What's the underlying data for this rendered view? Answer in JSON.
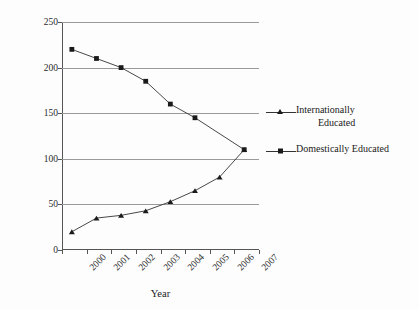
{
  "chart_data": {
    "type": "line",
    "title": "",
    "xlabel": "Year",
    "ylabel": "Number of Full-Time Nurses",
    "categories": [
      "2000",
      "2001",
      "2002",
      "2003",
      "2004",
      "2005",
      "2006",
      "2007"
    ],
    "x": [
      2000,
      2001,
      2002,
      2003,
      2004,
      2005,
      2006,
      2007
    ],
    "ylim": [
      0,
      250
    ],
    "yticks": [
      0,
      50,
      100,
      150,
      200,
      250
    ],
    "grid": "horizontal",
    "legend_position": "right",
    "series": [
      {
        "name": "Internationally Educated",
        "marker": "triangle",
        "values": [
          20,
          35,
          38,
          43,
          53,
          65,
          80,
          110
        ]
      },
      {
        "name": "Domestically Educated",
        "marker": "square",
        "values": [
          220,
          210,
          200,
          185,
          160,
          145,
          null,
          110
        ]
      }
    ],
    "colors": {
      "line": "#333333",
      "marker": "#1a1a1a",
      "grid": "#9a9a9a",
      "axis": "#555555"
    }
  },
  "axes": {
    "y_title": "Number of Full-Time Nurses",
    "x_title": "Year",
    "y_tick_labels": [
      "250",
      "200",
      "150",
      "100",
      "50",
      "0"
    ],
    "x_tick_labels": [
      "2000",
      "2001",
      "2002",
      "2003",
      "2004",
      "2005",
      "2006",
      "2007"
    ]
  },
  "legend": {
    "items": [
      {
        "label": "Internationally Educated",
        "line1": "Internationally",
        "line2": "Educated",
        "marker": "triangle-marker"
      },
      {
        "label": "Domestically Educated",
        "line1": "Domestically Educated",
        "line2": "",
        "marker": "square-marker"
      }
    ]
  }
}
